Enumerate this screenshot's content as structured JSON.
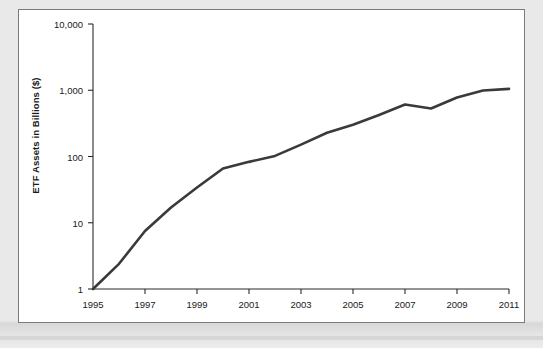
{
  "figure": {
    "background_color": "#e9e9e9",
    "panel_color": "#ffffff",
    "panel_border_color": "#7a7a7a"
  },
  "chart_data": {
    "type": "line",
    "title": "",
    "xlabel": "",
    "ylabel": "ETF Assets in Billions ($)",
    "yscale": "log",
    "ylim": [
      1,
      10000
    ],
    "xlim": [
      1995,
      2011
    ],
    "grid": false,
    "legend": null,
    "line_color": "#3a3a3a",
    "line_width": 2.6,
    "ytick_labels": [
      "10,000",
      "1,000",
      "100",
      "10",
      "1"
    ],
    "ytick_values": [
      10000,
      1000,
      100,
      10,
      1
    ],
    "xtick_labels": [
      "1995",
      "1997",
      "1999",
      "2001",
      "2003",
      "2005",
      "2007",
      "2009",
      "2011"
    ],
    "xtick_values": [
      1995,
      1997,
      1999,
      2001,
      2003,
      2005,
      2007,
      2009,
      2011
    ],
    "x": [
      1995,
      1996,
      1997,
      1998,
      1999,
      2000,
      2001,
      2002,
      2003,
      2004,
      2005,
      2006,
      2007,
      2008,
      2009,
      2010,
      2011
    ],
    "values": [
      1,
      2.4,
      7.5,
      17,
      34,
      66,
      83,
      102,
      151,
      228,
      301,
      423,
      608,
      531,
      777,
      992,
      1048
    ],
    "series": [
      {
        "name": "ETF Assets",
        "values": [
          1,
          2.4,
          7.5,
          17,
          34,
          66,
          83,
          102,
          151,
          228,
          301,
          423,
          608,
          531,
          777,
          992,
          1048
        ]
      }
    ]
  }
}
